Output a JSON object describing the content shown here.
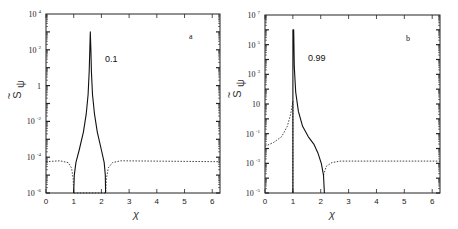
{
  "chart_data": [
    {
      "type": "line",
      "panel": "a",
      "annotation": "0.1",
      "xlabel": "χ",
      "ylabel": "S̃ψ",
      "yscale": "log",
      "xlim": [
        0,
        6.28
      ],
      "ylim_exponent": [
        -6,
        4
      ],
      "x_ticks": [
        "0",
        "1",
        "2",
        "3",
        "4",
        "5",
        "6"
      ],
      "y_ticks": [
        {
          "base": "10",
          "exp": "4",
          "value_exp": 4
        },
        {
          "base": "10",
          "exp": "2",
          "value_exp": 2
        },
        {
          "base": "1",
          "exp": "",
          "value_exp": 0
        },
        {
          "base": "10",
          "exp": "-2",
          "value_exp": -2
        },
        {
          "base": "10",
          "exp": "-4",
          "value_exp": -4
        },
        {
          "base": "10",
          "exp": "-6",
          "value_exp": -6
        }
      ],
      "series": [
        {
          "name": "solid",
          "style": "solid",
          "points": [
            [
              1.0,
              -6
            ],
            [
              1.02,
              -5
            ],
            [
              1.08,
              -4.3
            ],
            [
              1.2,
              -3.6
            ],
            [
              1.35,
              -2.6
            ],
            [
              1.45,
              -1.6
            ],
            [
              1.52,
              -0.5
            ],
            [
              1.56,
              0.8
            ],
            [
              1.58,
              2.0
            ],
            [
              1.6,
              3.0
            ],
            [
              1.62,
              2.0
            ],
            [
              1.64,
              0.8
            ],
            [
              1.68,
              -0.5
            ],
            [
              1.75,
              -1.6
            ],
            [
              1.85,
              -2.6
            ],
            [
              2.0,
              -3.6
            ],
            [
              2.1,
              -4.3
            ],
            [
              2.14,
              -5
            ],
            [
              2.15,
              -6
            ]
          ]
        },
        {
          "name": "dotted",
          "style": "dotted",
          "points": [
            [
              0,
              -4.25
            ],
            [
              0.5,
              -4.2
            ],
            [
              0.8,
              -4.3
            ],
            [
              0.92,
              -4.6
            ],
            [
              0.98,
              -5.2
            ],
            [
              1.0,
              -6
            ],
            [
              2.15,
              -6
            ],
            [
              2.18,
              -5.2
            ],
            [
              2.25,
              -4.6
            ],
            [
              2.4,
              -4.3
            ],
            [
              2.7,
              -4.2
            ],
            [
              6.28,
              -4.25
            ]
          ]
        }
      ]
    },
    {
      "type": "line",
      "panel": "b",
      "annotation": "0.99",
      "xlabel": "χ",
      "ylabel": "S̃ψ",
      "yscale": "log",
      "xlim": [
        0,
        6.28
      ],
      "ylim_exponent": [
        -5,
        7
      ],
      "x_ticks": [
        "0",
        "1",
        "2",
        "3",
        "4",
        "5",
        "6"
      ],
      "y_ticks": [
        {
          "base": "10",
          "exp": "7",
          "value_exp": 7
        },
        {
          "base": "10",
          "exp": "5",
          "value_exp": 5
        },
        {
          "base": "10",
          "exp": "3",
          "value_exp": 3
        },
        {
          "base": "10",
          "exp": "",
          "value_exp": 1
        },
        {
          "base": "10",
          "exp": "-1",
          "value_exp": -1
        },
        {
          "base": "10",
          "exp": "-3",
          "value_exp": -3
        },
        {
          "base": "10",
          "exp": "-5",
          "value_exp": -5
        }
      ],
      "series": [
        {
          "name": "solid",
          "style": "solid",
          "points": [
            [
              1.0,
              -5
            ],
            [
              1.0,
              6.0
            ],
            [
              1.03,
              6.0
            ],
            [
              1.05,
              3.5
            ],
            [
              1.1,
              1.8
            ],
            [
              1.2,
              0.5
            ],
            [
              1.35,
              -0.5
            ],
            [
              1.55,
              -1.2
            ],
            [
              1.75,
              -1.7
            ],
            [
              1.9,
              -2.3
            ],
            [
              2.02,
              -3.0
            ],
            [
              2.1,
              -3.8
            ],
            [
              2.13,
              -5
            ]
          ]
        },
        {
          "name": "dotted",
          "style": "dotted",
          "points": [
            [
              0,
              -1.85
            ],
            [
              0.3,
              -1.6
            ],
            [
              0.6,
              -1.2
            ],
            [
              0.8,
              -0.5
            ],
            [
              0.92,
              0.3
            ],
            [
              1.0,
              1.2
            ],
            [
              1.0,
              -5
            ]
          ],
          "points2": [
            [
              2.1,
              -3.8
            ],
            [
              2.2,
              -3.2
            ],
            [
              2.4,
              -2.95
            ],
            [
              2.7,
              -2.85
            ],
            [
              6.28,
              -2.85
            ]
          ]
        }
      ]
    }
  ],
  "panels": {
    "a": {
      "letter": "a",
      "annotation": "0.1",
      "xlabel": "χ",
      "ylabel_main": "S",
      "ylabel_sub": "ψ"
    },
    "b": {
      "letter": "b",
      "annotation": "0.99",
      "xlabel": "χ",
      "ylabel_main": "S",
      "ylabel_sub": "ψ"
    }
  }
}
